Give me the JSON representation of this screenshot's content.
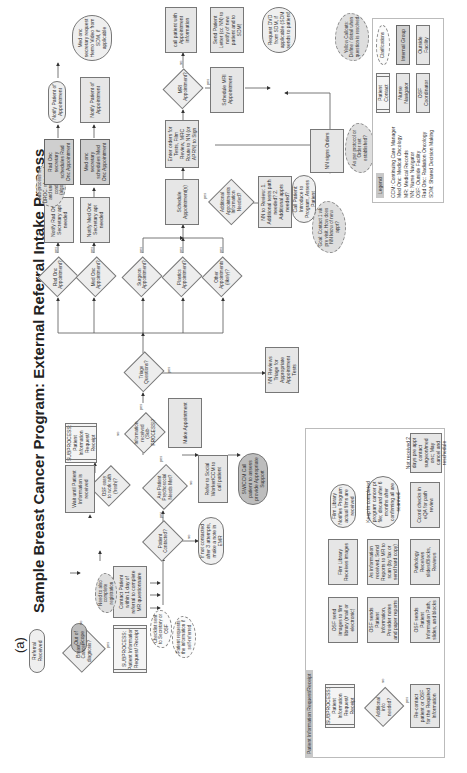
{
  "figure_label": "(a)",
  "title": "Sample Breast Cancer Program: External Referral Intake Process",
  "nodes": {
    "referral_received": "Referral Received",
    "breast_cancer_dx": "Breast Cancer diagnosis?",
    "out_of_scope": "Out of Scope",
    "sub_patient_info": "SUBPROCESS: Patient Information Request/ Receipt",
    "checklist_sent": "Checklist sent to Secretary or OSF",
    "patient_requests": "Patient requests the information if self-referred",
    "contact_patient": "Contact Patient within 1 day of referral to complete MR questionnaire",
    "need_to_also": "Need to also complete registration",
    "patient_contacted": "Patient Contacted?",
    "if_not_contacted": "If not contacted after 3 attempts, make a note in EMR",
    "psychosocial": "Are Patient Psychosocial Needs Met?",
    "refer_social": "Refer to Social Worker/CCM to call patient",
    "sw_ccm_call": "SW/CCM Call patient to assess provide Appropriate Support",
    "info_received": "Information received (Sub-PROCESS)?",
    "osf_easy": "OSF easy to work with (fresh)?",
    "wait_until": "Wait until Patient Information is received",
    "sub_patient_info_2": "SUBPROCESS: Patient Information Request/ Receipt",
    "make_appointment": "Make Appointment",
    "triage_questions": "Triage Questions?",
    "nn_reviews_triage": "NN Reviews Triage for Appropriate Appointment Tests",
    "rad_onc_appt": "Rad Onc Appointment?",
    "med_onc_appt": "Med Onc Appointment?",
    "surgeon_appt": "Surgeon Appointment?",
    "plastics_appt": "Plastics Appointment?",
    "other_appt": "Other Appointments (likely)?",
    "notify_rad_onc": "Notify Rad Onc Secretary apt needed",
    "notify_med_onc": "Notify Med Onc Secretary apt needed",
    "sub_process_for": "Sub-process for DROC: who sends and under what conditions (algorithm)",
    "rad_onc_secretary": "Rad Onc secretary schedules Rad Onc Appointment",
    "med_onc_secretary": "Med onc secretary schedules Med Onc Appointment",
    "notify_patient_rad": "Notify Patient of Appointment",
    "notify_patient_med": "Notify Patient of Appointment",
    "med_onc_request_video": "Med onc secretary request Hemo Video from SDM, if applicable",
    "schedule_appointments": "Schedule Appointment(s)",
    "additional_appt": "Additional Appointments Information Needed?",
    "nn_to_review": "NN to Review: 1. Additional tests path needed? 2. Additional appts needed?",
    "call_patient_intro": "Call Patient: Introduce to Program, Assess Patient",
    "goal_contact": "Goal: Contact 1 wk pre visit. How does NN know of new appt?",
    "enter_orders": "Enter orders for Tests, Film Review, MRC Route to NN (or APRN) to Sign",
    "mri_appt": "MRI Appointment?",
    "schedule_mri": "Schedule MRI Appointment",
    "nn_signs_orders": "NN signs Orders",
    "as_per_protocol": "As per protocol or Order set established?",
    "call_patient_appt": "call patient with Appointment information",
    "send_patient_letter": "Send Patient Letter (cc NN) to notify of new patient and to SDM)",
    "request_dvd": "Request DVD from SDM, if applicable (SDM sends to patient)"
  },
  "edge_labels": {
    "yes": "yes",
    "no": "no"
  },
  "legend": {
    "title": "Legend",
    "abbreviations": [
      "CCM: Continuing Care Manager",
      "Med Onc: Medical Oncology",
      "MR: Medical Records",
      "NN: Nurse Navigator",
      "OSF: Outside Facility",
      "Rad Onc: Radiation Oncology",
      "SDM: Shared Decision Making"
    ],
    "roles": {
      "patient_contact": "Patient Contact",
      "nurse_navigator": "Nurse Navigator",
      "osf_coordinator": "OSF Coordinator",
      "clarifications": "Clarifications",
      "internal_group": "Internal Group",
      "outside_facility": "Outside Facility"
    },
    "yellow_note": "Yellow Callouts: Define / detail when question is resolved"
  },
  "subpanel": {
    "title": "Patient Information Request/Receipt",
    "nodes": {
      "subprocess": "SUBPROCESS: Patient Information Request/ Receipt",
      "additional_info": "Additional info needed?",
      "recontact": "Re-contact patient or OSF for the Required Information",
      "osf_sends_images": "OSF send images to film library (mail or electronic)",
      "film_library": "Film Library Receives images",
      "film_library_notifies": "Film Library Notifies Program actual films are received",
      "osf_sends_info": "OSF sends Patient Information, Provider notes and paper reports",
      "as_information": "As information received, Send Reports to MR to scan (by fax or send hard copy)",
      "keep_in_program": "Keep in completed program cancer pt file; discard after 6 months after confirming all are scanned",
      "osf_sends_path": "OSF sends Patient Information Path, slides, and blocks",
      "pathology_receives": "Pathology Receives slides/Blocks, Reviews",
      "ccrd_checks": "Ccord checks in eQA for path review",
      "not_received": "Not received 2 days pre appt contact surgeon/med onc; May cancel and reschedule"
    }
  }
}
